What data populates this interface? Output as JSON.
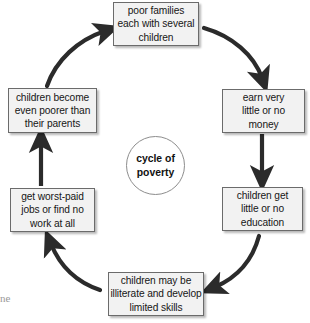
{
  "diagram": {
    "type": "cycle",
    "title": "cycle of poverty",
    "center": {
      "label": "cycle of\npoverty"
    },
    "nodes": [
      {
        "id": "poor-families",
        "label": "poor families\neach with several\nchildren",
        "position": "top"
      },
      {
        "id": "earn-very-little",
        "label": "earn very\nlittle or no\nmoney",
        "position": "top-right"
      },
      {
        "id": "children-little-education",
        "label": "children get\nlittle or no\neducation",
        "position": "bottom-right"
      },
      {
        "id": "illiterate-limited-skills",
        "label": "children may be\nilliterate and develop\nlimited skills",
        "position": "bottom"
      },
      {
        "id": "worst-paid-jobs",
        "label": "get worst-paid\njobs or find no\nwork at all",
        "position": "bottom-left"
      },
      {
        "id": "children-poorer",
        "label": "children become\neven poorer than\ntheir parents",
        "position": "top-left"
      }
    ],
    "edges": [
      {
        "from": "poor-families",
        "to": "earn-very-little",
        "style": "curved"
      },
      {
        "from": "earn-very-little",
        "to": "children-little-education",
        "style": "straight"
      },
      {
        "from": "children-little-education",
        "to": "illiterate-limited-skills",
        "style": "curved"
      },
      {
        "from": "illiterate-limited-skills",
        "to": "worst-paid-jobs",
        "style": "curved"
      },
      {
        "from": "worst-paid-jobs",
        "to": "children-poorer",
        "style": "straight"
      },
      {
        "from": "children-poorer",
        "to": "poor-families",
        "style": "curved"
      }
    ],
    "colors": {
      "box_fill": "#f2f2f2",
      "box_border": "#6b6b6b",
      "arrow": "#2b2b2b",
      "text": "#161616",
      "circle_border": "#8d8d8d"
    }
  },
  "page_artifact": {
    "edge_fragment": "ne"
  }
}
